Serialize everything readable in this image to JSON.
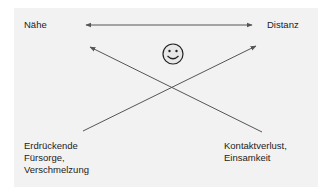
{
  "diagram": {
    "top_left_label": "Nähe",
    "top_right_label": "Distanz",
    "bottom_left_label": [
      "Erdrückende",
      "Fürsorge,",
      "Verschmelzung"
    ],
    "bottom_right_label": [
      "Kontaktverlust,",
      "Einsamkeit"
    ],
    "center_icon": "smiley-face-icon",
    "colors": {
      "panel_background": "#f2f2f2",
      "line": "#555555",
      "text": "#222222"
    }
  }
}
